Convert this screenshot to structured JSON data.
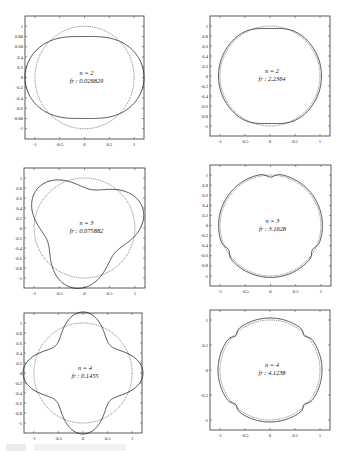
{
  "chart_data": [
    {
      "type": "line",
      "panel": "top-left",
      "title": "",
      "annotation": [
        "n = 2",
        "fr : 0.026829"
      ],
      "mode_number": 2,
      "frequency": 0.026829,
      "xticks": [
        "-1",
        "-0.5",
        "0",
        "0.5",
        "1"
      ],
      "yticks": [
        "1",
        "0.80",
        "0.60",
        "0.4",
        "0.2",
        "0",
        "-0.2",
        "-0.4",
        "-0.6",
        "-0.80",
        "-1"
      ],
      "xlim": [
        -1.2,
        1.2
      ],
      "ylim": [
        -1.2,
        1.2
      ],
      "series": [
        {
          "name": "reference circle (dotted)",
          "shape": "r = 1"
        },
        {
          "name": "mode shape (solid)",
          "shape": "r = 1 + 0.2 cos(2θ)"
        }
      ]
    },
    {
      "type": "line",
      "panel": "top-right",
      "annotation": [
        "n = 2",
        "fr : 2.2364"
      ],
      "mode_number": 2,
      "frequency": 2.2364,
      "xticks": [
        "-1",
        "-0.5",
        "0",
        "0.5",
        "1"
      ],
      "yticks": [
        "1",
        "0.8",
        "0.6",
        "0.4",
        "0.2",
        "0",
        "-0.2",
        "-0.4",
        "-0.6",
        "-0.8",
        "-1"
      ],
      "xlim": [
        -1.2,
        1.2
      ],
      "ylim": [
        -1.2,
        1.2
      ],
      "series": [
        {
          "name": "reference circle (dotted)",
          "shape": "r = 1"
        },
        {
          "name": "mode shape (solid)",
          "shape": "near-circle, flattened at top/bottom"
        }
      ]
    },
    {
      "type": "line",
      "panel": "middle-left",
      "annotation": [
        "n = 3",
        "fr : 0.075882"
      ],
      "mode_number": 3,
      "frequency": 0.075882,
      "xticks": [
        "-1",
        "-0.5",
        "0",
        "0.5",
        "1"
      ],
      "yticks": [
        "1",
        "0.8",
        "0.6",
        "0.4",
        "0.2",
        "0",
        "-0.2",
        "-0.4",
        "-0.6",
        "-0.8",
        "-1"
      ],
      "xlim": [
        -1.2,
        1.2
      ],
      "ylim": [
        -1.2,
        1.2
      ],
      "series": [
        {
          "name": "reference circle (dotted)",
          "shape": "r = 1"
        },
        {
          "name": "mode shape (solid)",
          "shape": "r = 1 + 0.2 cos(3θ)"
        }
      ]
    },
    {
      "type": "line",
      "panel": "middle-right",
      "annotation": [
        "n = 3",
        "fr : 3.1628"
      ],
      "mode_number": 3,
      "frequency": 3.1628,
      "xticks": [
        "-1",
        "-0.5",
        "0",
        "0.5",
        "1"
      ],
      "yticks": [
        "1",
        "0.8",
        "0.6",
        "0.4",
        "0.2",
        "0",
        "-0.2",
        "-0.4",
        "-0.6",
        "-0.8",
        "-1"
      ],
      "xlim": [
        -1.2,
        1.2
      ],
      "ylim": [
        -1.2,
        1.2
      ],
      "series": [
        {
          "name": "reference circle (dotted)",
          "shape": "r = 1"
        },
        {
          "name": "mode shape (solid)",
          "shape": "near-circle with 3 small notches"
        }
      ]
    },
    {
      "type": "line",
      "panel": "bottom-left",
      "annotation": [
        "n = 4",
        "fr : 0.1455"
      ],
      "mode_number": 4,
      "frequency": 0.1455,
      "xticks": [
        "-1",
        "-0.5",
        "0",
        "0.5",
        "1"
      ],
      "yticks": [
        "1",
        "0.8",
        "0.6",
        "0.4",
        "0.2",
        "0",
        "-0.2",
        "-0.4",
        "-0.6",
        "-0.8",
        "-1"
      ],
      "xlim": [
        -1.2,
        1.2
      ],
      "ylim": [
        -1.2,
        1.2
      ],
      "series": [
        {
          "name": "reference circle (dotted)",
          "shape": "r = 1"
        },
        {
          "name": "mode shape (solid)",
          "shape": "r = 1 + 0.2 cos(4θ)"
        }
      ]
    },
    {
      "type": "line",
      "panel": "bottom-right",
      "annotation": [
        "n = 4",
        "fr : 4.1238"
      ],
      "mode_number": 4,
      "frequency": 4.1238,
      "xticks": [
        "-1",
        "-0.5",
        "0",
        "0.5",
        "1"
      ],
      "yticks": [
        "1",
        "0.5",
        "0",
        "-0.5",
        "-1"
      ],
      "xlim": [
        -1.2,
        1.2
      ],
      "ylim": [
        -1.2,
        1.2
      ],
      "series": [
        {
          "name": "reference circle (dotted)",
          "shape": "r = 1"
        },
        {
          "name": "mode shape (solid)",
          "shape": "near-circle with 4 small notches"
        }
      ]
    }
  ]
}
